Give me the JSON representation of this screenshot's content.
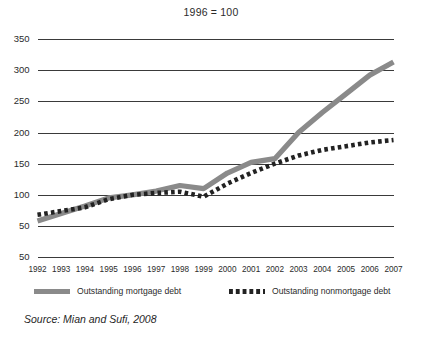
{
  "chart_data": {
    "type": "line",
    "title": "1996 = 100",
    "subtitle": "",
    "xlabel": "",
    "ylabel": "",
    "grid": "horizontal",
    "legend_position": "bottom",
    "xlim": [
      1992,
      2007
    ],
    "ylim": [
      50,
      350
    ],
    "categories": [
      1992,
      1993,
      1994,
      1995,
      1996,
      1997,
      1998,
      1999,
      2000,
      2001,
      2002,
      2003,
      2004,
      2005,
      2006,
      2007
    ],
    "x_tick_labels": [
      "1992",
      "1993",
      "1994",
      "1995",
      "1996",
      "1997",
      "1998",
      "1999",
      "2000",
      "2001",
      "2002",
      "2003",
      "2004",
      "2005",
      "2006",
      "2007"
    ],
    "y_tick_labels": [
      "350",
      "300",
      "250",
      "200",
      "150",
      "100",
      "50",
      "50"
    ],
    "y_tick_values": [
      350,
      300,
      250,
      200,
      150,
      100,
      50,
      0
    ],
    "series": [
      {
        "name": "Outstanding mortgage debt",
        "style": "solid",
        "color": "#8a8a8a",
        "values": [
          58,
          70,
          82,
          95,
          100,
          106,
          115,
          110,
          135,
          152,
          158,
          200,
          232,
          262,
          292,
          313
        ]
      },
      {
        "name": "Outstanding nonmortgage debt",
        "style": "dotted",
        "color": "#222222",
        "values": [
          68,
          74,
          80,
          93,
          100,
          103,
          105,
          97,
          118,
          135,
          150,
          163,
          172,
          178,
          184,
          188
        ]
      }
    ],
    "annotations": {
      "source": "Source: Mian and Sufi, 2008"
    }
  },
  "legend": {
    "entries": [
      {
        "label": "Outstanding mortgage debt",
        "swatch": "solid-gray-line-swatch"
      },
      {
        "label": "Outstanding nonmortgage debt",
        "swatch": "dotted-black-line-swatch"
      }
    ]
  },
  "source": {
    "text": "Source: Mian and Sufi, 2008"
  }
}
